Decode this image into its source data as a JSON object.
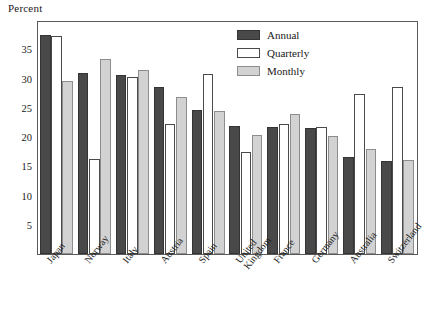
{
  "chart": {
    "ylabel": "Percent",
    "title": ""
  },
  "legend": {
    "position": "top-right",
    "entries": [
      {
        "label": "Annual",
        "color": "#494949",
        "key": "annual"
      },
      {
        "label": "Quarterly",
        "color": "#ffffff",
        "key": "quarterly"
      },
      {
        "label": "Monthly",
        "color": "#d2d2d2",
        "key": "monthly"
      }
    ]
  },
  "axis": {
    "y_ticks": [
      5,
      10,
      15,
      20,
      25,
      30,
      35
    ],
    "y_tick_labels": [
      "5",
      "10",
      "15",
      "20",
      "25",
      "30",
      "35"
    ],
    "y_min": 0,
    "y_max": 40,
    "minor_ticks": [
      2.5,
      7.5,
      12.5,
      17.5,
      22.5,
      27.5,
      32.5,
      37.5
    ]
  },
  "chart_data": {
    "type": "bar",
    "title": "",
    "xlabel": "",
    "ylabel": "Percent",
    "ylim": [
      0,
      40
    ],
    "grid": false,
    "legend_position": "top-right",
    "categories": [
      "Japan",
      "Norway",
      "Italy",
      "Austria",
      "Spain",
      "United Kingdom",
      "France",
      "Germany",
      "Australia",
      "Switzerland"
    ],
    "series": [
      {
        "name": "Annual",
        "color": "#494949",
        "values": [
          37.5,
          31.0,
          30.6,
          28.6,
          24.6,
          21.9,
          21.7,
          21.5,
          16.6,
          15.9
        ]
      },
      {
        "name": "Quarterly",
        "color": "#ffffff",
        "values": [
          37.2,
          16.2,
          30.3,
          22.3,
          30.8,
          17.4,
          22.3,
          21.7,
          27.4,
          28.6
        ]
      },
      {
        "name": "Monthly",
        "color": "#d2d2d2",
        "values": [
          29.5,
          33.3,
          31.4,
          26.8,
          24.5,
          20.3,
          23.9,
          20.1,
          18.0,
          16.1
        ]
      }
    ]
  }
}
